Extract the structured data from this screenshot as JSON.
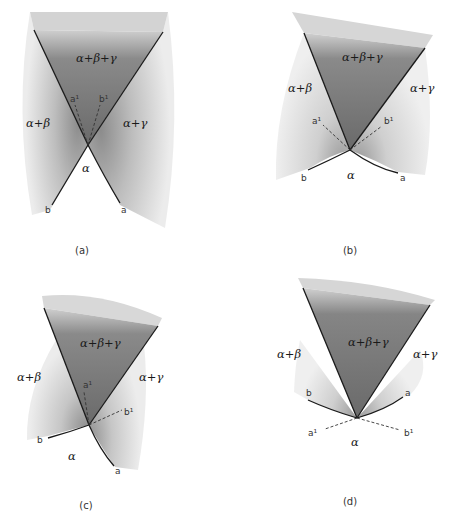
{
  "figure": {
    "panels": [
      {
        "id": "a",
        "caption": "(a)",
        "labels": {
          "three_phase": "α+β+γ",
          "left_two_phase": "α+β",
          "right_two_phase": "α+γ",
          "single_phase": "α",
          "curve_a": "a",
          "curve_b": "b",
          "ext_a": "a¹",
          "ext_b": "b¹"
        }
      },
      {
        "id": "b",
        "caption": "(b)",
        "labels": {
          "three_phase": "α+β+γ",
          "left_two_phase": "α+β",
          "right_two_phase": "α+γ",
          "single_phase": "α",
          "curve_a": "a",
          "curve_b": "b",
          "ext_a": "a¹",
          "ext_b": "b¹"
        }
      },
      {
        "id": "c",
        "caption": "(c)",
        "labels": {
          "three_phase": "α+β+γ",
          "left_two_phase": "α+β",
          "right_two_phase": "α+γ",
          "single_phase": "α",
          "curve_a": "a",
          "curve_b": "b",
          "ext_a": "a¹",
          "ext_b": "b¹"
        }
      },
      {
        "id": "d",
        "caption": "(d)",
        "labels": {
          "three_phase": "α+β+γ",
          "left_two_phase": "α+β",
          "right_two_phase": "α+γ",
          "single_phase": "α",
          "curve_a": "a",
          "curve_b": "b",
          "ext_a": "a¹",
          "ext_b": "b¹"
        }
      }
    ],
    "colors": {
      "three_phase_fill": "#7a7a7a",
      "two_phase_fill": "#d9d9d9",
      "boundary_line": "#1a1a1a",
      "dashed_line": "#333333"
    }
  }
}
